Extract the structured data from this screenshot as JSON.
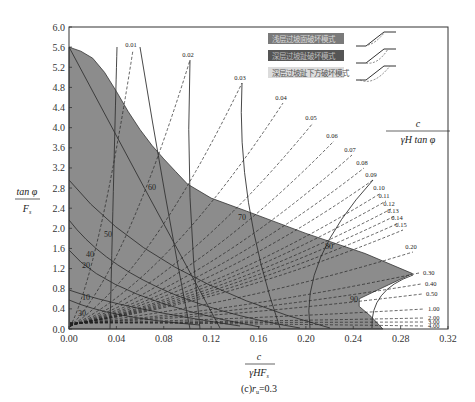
{
  "chart_data": {
    "type": "line",
    "title": "",
    "caption": "(c)r_u=0.3",
    "caption_parts": {
      "prefix": "(c)",
      "var": "r",
      "sub": "u",
      "suffix": "=0.3"
    },
    "xlabel": {
      "numerator": "c",
      "denominator": "γHF",
      "denominator_sub": "s"
    },
    "ylabel": {
      "numerator": "tan φ",
      "denominator": "F",
      "denominator_sub": "s"
    },
    "contour_label": {
      "numerator": "c",
      "denominator": "γH tan φ"
    },
    "xlim": [
      0.0,
      0.32
    ],
    "ylim": [
      0.0,
      6.0
    ],
    "x_ticks": [
      "0.00",
      "0.04",
      "0.08",
      "0.12",
      "0.16",
      "0.20",
      "0.24",
      "0.28",
      "0.32"
    ],
    "y_ticks": [
      "0.0",
      "0.4",
      "0.8",
      "1.2",
      "1.6",
      "2.0",
      "2.4",
      "2.8",
      "3.2",
      "3.6",
      "4.0",
      "4.4",
      "4.8",
      "5.2",
      "5.6",
      "6.0"
    ],
    "grid": false,
    "legend_position": "upper right",
    "legend": [
      {
        "label": "浅层过坡面破坏模式",
        "color": "#7a7a7a",
        "text_color": "#d8d8d8"
      },
      {
        "label": "深层过坡趾破坏模式",
        "color": "#555555",
        "text_color": "#bdbdbd"
      },
      {
        "label": "深层过坡趾下方破坏模式",
        "color": "#dcdcdc",
        "text_color": "#555555"
      }
    ],
    "dashed_contours_c_over_gammaH_tanphi": [
      "0.01",
      "0.02",
      "0.03",
      "0.04",
      "0.05",
      "0.06",
      "0.07",
      "0.08",
      "0.09",
      "0.10",
      "0.11",
      "0.12",
      "0.13",
      "0.14",
      "0.15",
      "0.20",
      "0.30",
      "0.40",
      "0.50",
      "1.00",
      "2.00",
      "3.00",
      "4.00"
    ],
    "solid_contours_slope_angle_deg": [
      "10",
      "20",
      "30",
      "40",
      "50",
      "60",
      "70",
      "80",
      "90"
    ],
    "region_boundary_points": [
      [
        0.0,
        5.6
      ],
      [
        0.01,
        5.52
      ],
      [
        0.02,
        5.38
      ],
      [
        0.03,
        5.1
      ],
      [
        0.04,
        4.72
      ],
      [
        0.05,
        4.32
      ],
      [
        0.06,
        3.96
      ],
      [
        0.07,
        3.65
      ],
      [
        0.08,
        3.38
      ],
      [
        0.09,
        3.13
      ],
      [
        0.1,
        2.88
      ],
      [
        0.12,
        2.6
      ],
      [
        0.15,
        2.34
      ],
      [
        0.2,
        1.9
      ],
      [
        0.25,
        1.5
      ],
      [
        0.29,
        1.1
      ],
      [
        0.27,
        0.88
      ],
      [
        0.245,
        0.6
      ],
      [
        0.245,
        0.45
      ],
      [
        0.255,
        0.25
      ],
      [
        0.265,
        0.0
      ]
    ]
  }
}
